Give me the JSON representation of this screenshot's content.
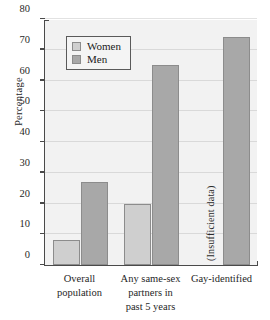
{
  "chart_data": {
    "type": "bar",
    "title": "",
    "subtitle": "",
    "xlabel": "",
    "ylabel": "Percentage",
    "ylim": [
      0,
      80
    ],
    "yticks": [
      0,
      10,
      20,
      30,
      40,
      50,
      60,
      70,
      80
    ],
    "grid": true,
    "legend_position": "upper left inside",
    "categories": [
      "Overall population",
      "Any same-sex partners in past 5 years",
      "Gay-identified"
    ],
    "category_lines": [
      [
        "Overall",
        "population"
      ],
      [
        "Any same-sex",
        "partners in",
        "past 5 years"
      ],
      [
        "Gay-identified"
      ]
    ],
    "series": [
      {
        "name": "Women",
        "color": "#cfcfcf",
        "values": [
          8,
          20,
          null
        ],
        "value_labels": [
          "8",
          "20",
          "(Insufficient data)"
        ]
      },
      {
        "name": "Men",
        "color": "#a8a8a8",
        "values": [
          27,
          65,
          74
        ],
        "value_labels": [
          "27",
          "65",
          "74"
        ]
      }
    ],
    "annotations": [
      {
        "text": "(Insufficient data)",
        "category": "Gay-identified",
        "series": "Women",
        "rotation": -90
      }
    ]
  },
  "legend": {
    "items": [
      {
        "label": "Women",
        "swatch": "women-swatch"
      },
      {
        "label": "Men",
        "swatch": "men-swatch"
      }
    ]
  },
  "axis": {
    "y_title": "Percentage",
    "y_ticks": [
      "0",
      "10",
      "20",
      "30",
      "40",
      "50",
      "60",
      "70",
      "80"
    ]
  },
  "colors": {
    "women_fill": "#cfcfcf",
    "men_fill": "#a8a8a8",
    "bar_edge": "#8c8c8c",
    "plot_background": "#f2f2f2",
    "gridline": "#d9d9d9",
    "axis": "#4a4a4a",
    "figure_background": "#ffffff"
  }
}
